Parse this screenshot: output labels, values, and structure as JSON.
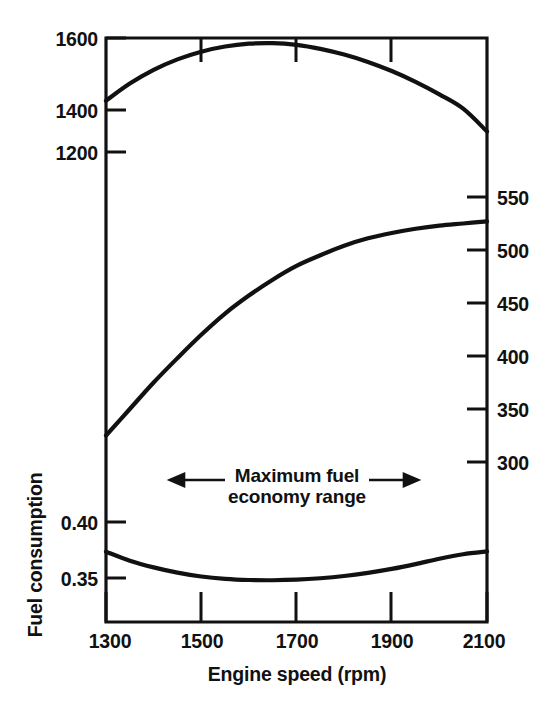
{
  "chart_data": {
    "type": "line",
    "title": "",
    "xlabel": "Engine speed (rpm)",
    "ylabel_left_lower": "Fuel consumption",
    "xlim": [
      1300,
      2100
    ],
    "xticks": [
      1300,
      1500,
      1700,
      1900,
      2100
    ],
    "xtick_labels": [
      "1300",
      "1500",
      "1700",
      "1900",
      "2100"
    ],
    "grid": false,
    "legend": "none",
    "axes": [
      {
        "id": "left-upper",
        "side": "left",
        "ticks": [
          1200,
          1400,
          1600
        ],
        "tick_labels": [
          "1200",
          "1400",
          "1600"
        ],
        "lim": [
          1200,
          1600
        ],
        "unit": ""
      },
      {
        "id": "right",
        "side": "right",
        "ticks": [
          300,
          350,
          400,
          450,
          500,
          550
        ],
        "tick_labels": [
          "300",
          "350",
          "400",
          "450",
          "500",
          "550"
        ],
        "lim": [
          300,
          550
        ],
        "unit": ""
      },
      {
        "id": "left-lower",
        "side": "left",
        "ticks": [
          0.35,
          0.4
        ],
        "tick_labels": [
          "0.35",
          "0.40"
        ],
        "lim": [
          0.35,
          0.4
        ],
        "unit": ""
      }
    ],
    "series": [
      {
        "name": "upper-curve",
        "axis": "left-upper",
        "x": [
          1300,
          1350,
          1400,
          1450,
          1500,
          1550,
          1600,
          1650,
          1700,
          1750,
          1800,
          1850,
          1900,
          1950,
          2000,
          2050,
          2100
        ],
        "values": [
          1380,
          1440,
          1488,
          1525,
          1552,
          1570,
          1580,
          1582,
          1576,
          1562,
          1542,
          1516,
          1484,
          1446,
          1402,
          1352,
          1272
        ]
      },
      {
        "name": "middle-curve",
        "axis": "right",
        "x": [
          1300,
          1350,
          1400,
          1450,
          1500,
          1550,
          1600,
          1650,
          1700,
          1750,
          1800,
          1850,
          1900,
          1950,
          2000,
          2050,
          2100
        ],
        "values": [
          325,
          350,
          375,
          398,
          420,
          440,
          457,
          472,
          485,
          495,
          504,
          511,
          516,
          520,
          523,
          525,
          527
        ]
      },
      {
        "name": "lower-curve",
        "axis": "left-lower",
        "x": [
          1300,
          1350,
          1400,
          1450,
          1500,
          1550,
          1600,
          1650,
          1700,
          1750,
          1800,
          1850,
          1900,
          1950,
          2000,
          2050,
          2100
        ],
        "values": [
          0.3735,
          0.3655,
          0.3595,
          0.3548,
          0.3513,
          0.3492,
          0.3482,
          0.348,
          0.3485,
          0.3498,
          0.3518,
          0.3546,
          0.3581,
          0.3624,
          0.3672,
          0.3712,
          0.3737
        ]
      }
    ],
    "annotations": [
      {
        "id": "max-fuel-economy-range",
        "line1": "Maximum fuel",
        "line2": "economy range",
        "arrow_left": "←",
        "arrow_right": "→",
        "x_span": [
          1470,
          1880
        ]
      }
    ],
    "colors": {
      "line": "#111111",
      "axis": "#111111",
      "background": "#ffffff"
    }
  }
}
